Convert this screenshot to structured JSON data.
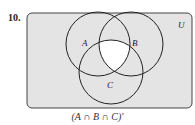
{
  "problem": {
    "number": "10.",
    "caption": "(A ∩ B ∩ C)′"
  },
  "diagram": {
    "universe_label": "U",
    "sets": [
      {
        "label": "A"
      },
      {
        "label": "B"
      },
      {
        "label": "C"
      }
    ],
    "shaded_region": "complement of A ∩ B ∩ C",
    "colors": {
      "shade": "#e4e4e4",
      "unshaded": "#ffffff",
      "stroke": "#222222"
    }
  }
}
